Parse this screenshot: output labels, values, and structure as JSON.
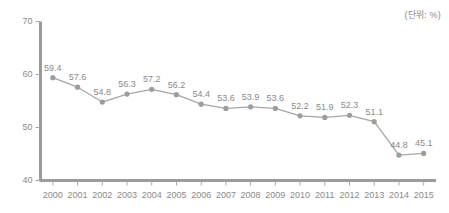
{
  "unit_note": "(단위: %)",
  "chart_data": {
    "type": "line",
    "title": "",
    "subtitle": "",
    "xlabel": "",
    "ylabel": "",
    "unit_note": "(단위: %)",
    "categories": [
      "2000",
      "2001",
      "2002",
      "2003",
      "2004",
      "2005",
      "2006",
      "2007",
      "2008",
      "2009",
      "2010",
      "2011",
      "2012",
      "2013",
      "2014",
      "2015"
    ],
    "values": [
      59.4,
      57.6,
      54.8,
      56.3,
      57.2,
      56.2,
      54.4,
      53.6,
      53.9,
      53.6,
      52.2,
      51.9,
      52.3,
      51.1,
      44.8,
      45.1
    ],
    "point_labels": [
      "59.4",
      "57.6",
      "54.8",
      "56.3",
      "57.2",
      "56.2",
      "54.4",
      "53.6",
      "53.9",
      "53.6",
      "52.2",
      "51.9",
      "52.3",
      "51.1",
      "44.8",
      "45.1"
    ],
    "ylim": [
      40,
      70
    ],
    "yticks": [
      40,
      50,
      60,
      70
    ],
    "ytick_labels": [
      "40",
      "50",
      "60",
      "70"
    ],
    "grid": false,
    "legend": false,
    "legend_position": "none",
    "series": [
      {
        "name": "",
        "values": [
          59.4,
          57.6,
          54.8,
          56.3,
          57.2,
          56.2,
          54.4,
          53.6,
          53.9,
          53.6,
          52.2,
          51.9,
          52.3,
          51.1,
          44.8,
          45.1
        ],
        "color": "#a6a6a6",
        "marker": "circle"
      }
    ],
    "colors": {
      "line": "#a6a6a6",
      "marker": "#9d9d9d",
      "axis": "#9b9b9b",
      "text": "#8a8a8a",
      "background": "#ffffff"
    }
  }
}
